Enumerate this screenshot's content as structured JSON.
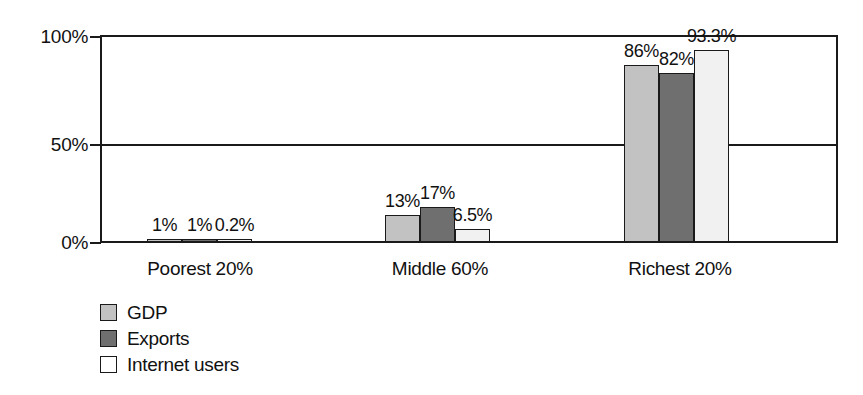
{
  "chart_data": {
    "type": "bar",
    "title": "",
    "subtitle": "",
    "xlabel": "",
    "ylabel": "",
    "categories": [
      "Poorest 20%",
      "Middle 60%",
      "Richest 20%"
    ],
    "series": [
      {
        "name": "GDP",
        "color": "#c2c2c2",
        "values": [
          1,
          13,
          86
        ],
        "labels": [
          "1%",
          "13%",
          "86%"
        ]
      },
      {
        "name": "Exports",
        "color": "#6f6f6f",
        "values": [
          1,
          17,
          82
        ],
        "labels": [
          "1%",
          "17%",
          "82%"
        ]
      },
      {
        "name": "Internet users",
        "color": "#f1f1f1",
        "values": [
          0.2,
          6.5,
          93.3
        ],
        "labels": [
          "0.2%",
          "6.5%",
          "93.3%"
        ]
      }
    ],
    "ylim": [
      0,
      100
    ],
    "yticks": [
      0,
      50,
      100
    ],
    "ytick_labels": [
      "0%",
      "50%",
      "100%"
    ],
    "grid": true,
    "gridlines": [
      "50%",
      "100%"
    ],
    "legend_position": "bottom-left",
    "bar_border_color": "#1a1a1a",
    "axis_color": "#1a1a1a",
    "background": "#ffffff"
  },
  "legend": {
    "items": [
      {
        "label": "GDP"
      },
      {
        "label": "Exports"
      },
      {
        "label": "Internet users"
      }
    ]
  }
}
